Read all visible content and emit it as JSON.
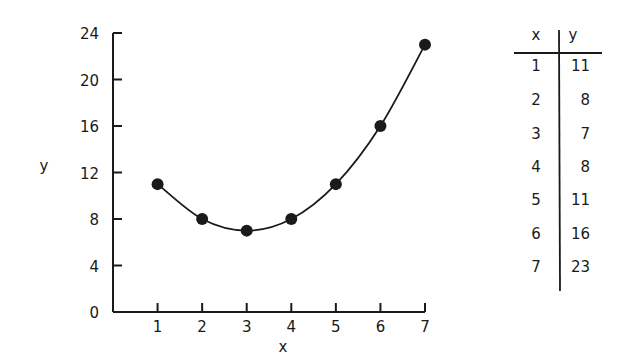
{
  "chart_data": {
    "type": "line",
    "title": "",
    "xlabel": "x",
    "ylabel": "y",
    "x": [
      1,
      2,
      3,
      4,
      5,
      6,
      7
    ],
    "series": [
      {
        "name": "y",
        "values": [
          11,
          8,
          7,
          8,
          11,
          16,
          23
        ],
        "markers": true,
        "smooth": true
      }
    ],
    "xlim": [
      0,
      7
    ],
    "ylim": [
      0,
      24
    ],
    "xticks": [
      "1",
      "2",
      "3",
      "4",
      "5",
      "6",
      "7"
    ],
    "yticks": [
      "0",
      "4",
      "8",
      "12",
      "16",
      "20",
      "24"
    ],
    "grid": false,
    "legend": null
  },
  "table": {
    "headers": [
      "x",
      "y"
    ],
    "rows": [
      [
        "1",
        "11"
      ],
      [
        "2",
        "8"
      ],
      [
        "3",
        "7"
      ],
      [
        "4",
        "8"
      ],
      [
        "5",
        "11"
      ],
      [
        "6",
        "16"
      ],
      [
        "7",
        "23"
      ]
    ]
  },
  "colors": {
    "ink": "#1a1a1a",
    "background": "#ffffff"
  }
}
